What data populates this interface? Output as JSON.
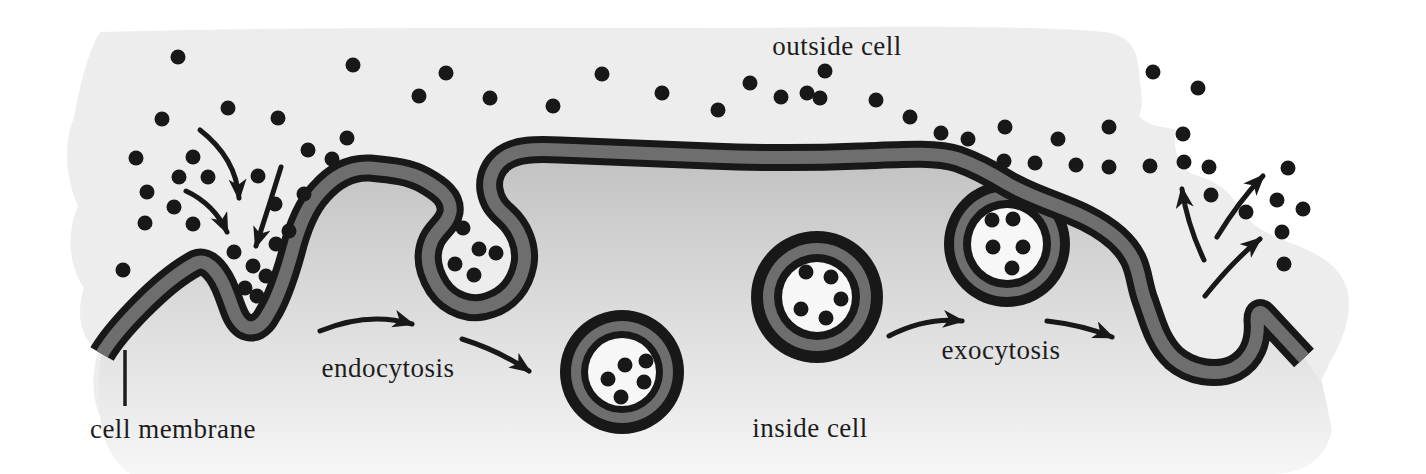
{
  "figure": {
    "labels": {
      "outside_cell": "outside cell",
      "inside_cell": "inside cell",
      "cell_membrane": "cell membrane",
      "endocytosis": "endocytosis",
      "exocytosis": "exocytosis"
    },
    "colors": {
      "ink": "#181818",
      "membrane_gray": "#6e6e6e",
      "fluid_white": "#f7f7f7",
      "background_wash": "#ededed",
      "interior_top": "#c0c0c0",
      "interior_mid": "#d4d4d4",
      "interior_low": "#e7e7e7",
      "interior_bottom": "#f6f6f6",
      "label_ink": "#1c1c1c"
    },
    "geometry": {
      "wash_path": "M 100,32 C 350,25 600,30 850,27 C 980,26 1060,28 1105,32 C 1128,35 1136,48 1138,64 C 1141,90 1144,105 1139,116 C 1150,128 1166,126 1176,130 C 1172,152 1180,166 1192,174 C 1222,182 1232,196 1238,206 C 1250,226 1268,234 1288,242 C 1322,254 1342,268 1348,292 C 1352,318 1342,342 1330,362 C 1318,390 1302,412 1288,424 C 1272,444 1246,446 1222,442 C 1050,450 850,446 700,450 C 500,456 320,458 210,454 C 140,452 112,444 104,424 C 90,400 92,372 98,352 C 76,334 78,306 84,288 C 64,258 70,224 78,206 C 62,170 66,136 74,118 C 80,84 88,52 100,32 Z",
      "membrane_path": "M 102,354 C 115,332 160,282 196,263 C 208,258 220,274 227,293 C 233,308 235,320 244,326 C 253,331 262,326 268,314 C 277,300 285,277 292,252 C 298,228 306,207 320,192 C 333,177 350,167 370,168 C 392,170 410,172 424,180 C 440,189 452,198 450,212 C 448,224 438,228 432,240 C 425,255 428,271 438,287 C 450,305 472,312 490,305 C 508,299 520,285 524,264 C 527,245 518,227 506,216 C 497,208 492,202 490,190 C 488,177 494,165 504,158 C 517,149 535,149 560,150 C 610,152 660,154 710,156 C 760,158 815,158 860,156 C 905,154 938,152 958,159 C 978,166 992,174 1008,184 C 1032,198 1062,206 1086,218 C 1106,228 1124,241 1133,259 C 1140,273 1139,285 1146,303 C 1153,323 1158,343 1174,358 C 1190,372 1216,377 1235,368 C 1252,359 1259,341 1257,320 C 1257,312 1260,310 1265,316 C 1278,330 1293,346 1304,358",
      "interior_close": " L 1322,382 L 1332,430 Q 1322,474 1270,474 L 130,474 Q 100,450 100,410 Q 96,380 102,354 Z",
      "membrane_outer_width": 27,
      "membrane_inner_width": 13,
      "vesicles": [
        {
          "name": "fused-vesicle",
          "under": true,
          "cx": 1007,
          "cy": 244,
          "rings": [
            {
              "r": 63,
              "c": "ink"
            },
            {
              "r": 53,
              "c": "gray"
            },
            {
              "r": 44,
              "c": "ink"
            },
            {
              "r": 36,
              "c": "white"
            }
          ],
          "dots": [
            [
              992,
              220
            ],
            [
              1013,
              219
            ],
            [
              993,
              247
            ],
            [
              1023,
              247
            ],
            [
              1012,
              268
            ]
          ]
        },
        {
          "name": "endocytic-vesicle",
          "under": false,
          "cx": 622,
          "cy": 372,
          "rings": [
            {
              "r": 62,
              "c": "ink"
            },
            {
              "r": 51,
              "c": "gray"
            },
            {
              "r": 41,
              "c": "ink"
            },
            {
              "r": 34,
              "c": "white"
            }
          ],
          "dots": [
            [
              625,
              365
            ],
            [
              646,
              361
            ],
            [
              608,
              379
            ],
            [
              644,
              382
            ],
            [
              621,
              397
            ]
          ]
        },
        {
          "name": "exocytic-vesicle",
          "under": false,
          "cx": 817,
          "cy": 297,
          "rings": [
            {
              "r": 66,
              "c": "ink"
            },
            {
              "r": 54,
              "c": "gray"
            },
            {
              "r": 43,
              "c": "ink"
            },
            {
              "r": 35,
              "c": "white"
            }
          ],
          "dots": [
            [
              806,
              272
            ],
            [
              831,
              277
            ],
            [
              841,
              299
            ],
            [
              801,
              309
            ],
            [
              826,
              318
            ]
          ]
        }
      ],
      "pit_dots": [
        [
          234,
          252
        ],
        [
          253,
          266
        ],
        [
          266,
          276
        ],
        [
          245,
          288
        ],
        [
          257,
          296
        ],
        [
          463,
          228
        ],
        [
          479,
          249
        ],
        [
          496,
          253
        ],
        [
          455,
          264
        ],
        [
          474,
          275
        ]
      ],
      "outside_dots": [
        [
          178,
          57
        ],
        [
          162,
          119
        ],
        [
          228,
          108
        ],
        [
          278,
          118
        ],
        [
          136,
          158
        ],
        [
          193,
          157
        ],
        [
          308,
          150
        ],
        [
          347,
          138
        ],
        [
          179,
          177
        ],
        [
          208,
          177
        ],
        [
          258,
          176
        ],
        [
          332,
          159
        ],
        [
          147,
          192
        ],
        [
          174,
          207
        ],
        [
          275,
          204
        ],
        [
          304,
          194
        ],
        [
          145,
          223
        ],
        [
          193,
          224
        ],
        [
          289,
          231
        ],
        [
          276,
          244
        ],
        [
          123,
          270
        ],
        [
          353,
          65
        ],
        [
          446,
          73
        ],
        [
          419,
          96
        ],
        [
          490,
          98
        ],
        [
          553,
          106
        ],
        [
          602,
          74
        ],
        [
          662,
          93
        ],
        [
          718,
          110
        ],
        [
          750,
          83
        ],
        [
          807,
          93
        ],
        [
          825,
          71
        ],
        [
          781,
          97
        ],
        [
          820,
          98
        ],
        [
          876,
          100
        ],
        [
          910,
          117
        ],
        [
          941,
          133
        ],
        [
          968,
          139
        ],
        [
          1005,
          127
        ],
        [
          1035,
          163
        ],
        [
          1004,
          161
        ],
        [
          1076,
          165
        ],
        [
          1109,
          127
        ],
        [
          1153,
          72
        ],
        [
          1198,
          88
        ],
        [
          1058,
          139
        ],
        [
          1109,
          167
        ],
        [
          1150,
          166
        ],
        [
          1183,
          134
        ],
        [
          1184,
          162
        ],
        [
          1209,
          167
        ],
        [
          1211,
          195
        ],
        [
          1246,
          212
        ],
        [
          1288,
          168
        ],
        [
          1277,
          200
        ],
        [
          1303,
          209
        ],
        [
          1282,
          232
        ],
        [
          1284,
          264
        ]
      ],
      "dot_radius": 7.5,
      "arrows": [
        {
          "name": "endocytosis-intake-arrow",
          "d": "M 200,130 Q 236,158 239,198"
        },
        {
          "name": "endocytosis-intake-arrow",
          "d": "M 186,191 Q 214,204 227,232"
        },
        {
          "name": "endocytosis-intake-arrow",
          "d": "M 281,167 Q 269,206 256,246"
        },
        {
          "name": "endocytosis-step-arrow",
          "d": "M 320,331 Q 368,311 412,324"
        },
        {
          "name": "endocytosis-step-arrow",
          "d": "M 462,339 Q 500,351 529,371"
        },
        {
          "name": "exocytosis-step-arrow",
          "d": "M 889,336 Q 926,317 962,321"
        },
        {
          "name": "exocytosis-step-arrow",
          "d": "M 1047,321 Q 1083,325 1112,337"
        },
        {
          "name": "exocytosis-release-arrow",
          "d": "M 1204,260 Q 1187,224 1182,189"
        },
        {
          "name": "exocytosis-release-arrow",
          "d": "M 1217,237 Q 1239,201 1263,176"
        },
        {
          "name": "exocytosis-release-arrow",
          "d": "M 1205,296 Q 1233,261 1260,239"
        }
      ],
      "arrow_width": 5
    }
  }
}
